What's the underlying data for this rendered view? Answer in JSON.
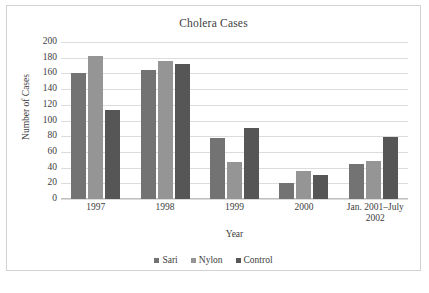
{
  "figure": {
    "border_color": "#d2d2d2",
    "background": "#ffffff"
  },
  "caption_fragment": "",
  "legend": {
    "position": "bottom",
    "items": [
      {
        "label": "Sari",
        "color": "#737373",
        "swatch": "square-swatch"
      },
      {
        "label": "Nylon",
        "color": "#959595",
        "swatch": "square-swatch"
      },
      {
        "label": "Control",
        "color": "#565656",
        "swatch": "square-swatch"
      }
    ]
  },
  "chart_data": {
    "type": "bar",
    "title": "Cholera Cases",
    "xlabel": "Year",
    "ylabel": "Number of Cases",
    "categories": [
      "1997",
      "1998",
      "1999",
      "2000",
      "Jan. 2001–July 2002"
    ],
    "series": [
      {
        "name": "Sari",
        "color": "#737373",
        "values": [
          161,
          164,
          78,
          20,
          44
        ]
      },
      {
        "name": "Nylon",
        "color": "#959595",
        "values": [
          182,
          176,
          47,
          36,
          49
        ]
      },
      {
        "name": "Control",
        "color": "#565656",
        "values": [
          113,
          172,
          91,
          30,
          79
        ]
      }
    ],
    "ylim": [
      0,
      200
    ],
    "yticks": [
      0,
      20,
      40,
      60,
      80,
      100,
      120,
      140,
      160,
      180,
      200
    ],
    "ytick_labels": [
      "0",
      "20",
      "40",
      "60",
      "80",
      "100",
      "120",
      "140",
      "160",
      "180",
      "200"
    ],
    "grid": "horizontal",
    "legend_position": "bottom"
  }
}
